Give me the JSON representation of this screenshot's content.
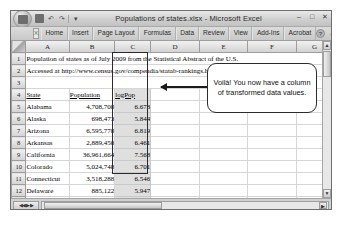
{
  "window": {
    "title": "Populations of states.xlsx - Microsoft Excel",
    "office_orb": "office-button",
    "quick_access": [
      {
        "name": "save",
        "glyph": ""
      },
      {
        "name": "undo",
        "glyph": "↶"
      },
      {
        "name": "redo",
        "glyph": "↷"
      },
      {
        "name": "customize",
        "glyph": "▾"
      }
    ],
    "buttons": {
      "minimize": "–",
      "maximize": "□",
      "close": "✕"
    }
  },
  "ribbon": {
    "logo": "X",
    "tabs": [
      "Home",
      "Insert",
      "Page Layout",
      "Formulas",
      "Data",
      "Review",
      "View",
      "Add-Ins",
      "Acrobat"
    ],
    "help": "?",
    "minimize": "–",
    "restore": "□",
    "close": "✕"
  },
  "sheet": {
    "corner": "",
    "columns": [
      "A",
      "B",
      "C",
      "D",
      "E",
      "F",
      "G"
    ],
    "rows": [
      {
        "number": "1",
        "cells": [
          {
            "text": "Population of states as of July 2009 from the Statistical Abstract of the U.S.",
            "span": 7,
            "align": "left",
            "selected": false,
            "underline": false
          }
        ]
      },
      {
        "number": "2",
        "cells": [
          {
            "text": "Accessed at http://www.census.gov/compendia/statab-rankings.html on July 3, 2010",
            "span": 7,
            "align": "left",
            "selected": false,
            "underline": false
          }
        ]
      },
      {
        "number": "3",
        "cells": [
          {
            "text": "",
            "span": 7,
            "align": "left",
            "selected": false,
            "underline": false
          }
        ]
      },
      {
        "number": "4",
        "cells": [
          {
            "text": "State",
            "span": 1,
            "align": "left",
            "selected": false,
            "underline": true
          },
          {
            "text": "Population",
            "span": 1,
            "align": "left",
            "selected": false,
            "underline": true
          },
          {
            "text": "logPop",
            "span": 1,
            "align": "left",
            "selected": true,
            "underline": true
          },
          {
            "text": "",
            "span": 1,
            "align": "left",
            "selected": false,
            "underline": false
          },
          {
            "text": "",
            "span": 1,
            "align": "left",
            "selected": false,
            "underline": false
          },
          {
            "text": "",
            "span": 1,
            "align": "left",
            "selected": false,
            "underline": false
          },
          {
            "text": "",
            "span": 1,
            "align": "left",
            "selected": false,
            "underline": false
          }
        ]
      },
      {
        "number": "5",
        "cells": [
          {
            "text": "Alabama",
            "span": 1,
            "align": "left",
            "selected": false,
            "underline": false
          },
          {
            "text": "4,708,708",
            "span": 1,
            "align": "right",
            "selected": false,
            "underline": false
          },
          {
            "text": "6.673",
            "span": 1,
            "align": "right",
            "selected": true,
            "underline": false
          },
          {
            "text": "",
            "span": 1,
            "align": "left",
            "selected": false,
            "underline": false
          },
          {
            "text": "",
            "span": 1,
            "align": "left",
            "selected": false,
            "underline": false
          },
          {
            "text": "",
            "span": 1,
            "align": "left",
            "selected": false,
            "underline": false
          },
          {
            "text": "",
            "span": 1,
            "align": "left",
            "selected": false,
            "underline": false
          }
        ]
      },
      {
        "number": "6",
        "cells": [
          {
            "text": "Alaska",
            "span": 1,
            "align": "left",
            "selected": false,
            "underline": false
          },
          {
            "text": "698,473",
            "span": 1,
            "align": "right",
            "selected": false,
            "underline": false
          },
          {
            "text": "5.844",
            "span": 1,
            "align": "right",
            "selected": true,
            "underline": false
          },
          {
            "text": "",
            "span": 1,
            "align": "left",
            "selected": false,
            "underline": false
          },
          {
            "text": "",
            "span": 1,
            "align": "left",
            "selected": false,
            "underline": false
          },
          {
            "text": "",
            "span": 1,
            "align": "left",
            "selected": false,
            "underline": false
          },
          {
            "text": "",
            "span": 1,
            "align": "left",
            "selected": false,
            "underline": false
          }
        ]
      },
      {
        "number": "7",
        "cells": [
          {
            "text": "Arizona",
            "span": 1,
            "align": "left",
            "selected": false,
            "underline": false
          },
          {
            "text": "6,595,778",
            "span": 1,
            "align": "right",
            "selected": false,
            "underline": false
          },
          {
            "text": "6.819",
            "span": 1,
            "align": "right",
            "selected": true,
            "underline": false
          },
          {
            "text": "",
            "span": 1,
            "align": "left",
            "selected": false,
            "underline": false
          },
          {
            "text": "",
            "span": 1,
            "align": "left",
            "selected": false,
            "underline": false
          },
          {
            "text": "",
            "span": 1,
            "align": "left",
            "selected": false,
            "underline": false
          },
          {
            "text": "",
            "span": 1,
            "align": "left",
            "selected": false,
            "underline": false
          }
        ]
      },
      {
        "number": "8",
        "cells": [
          {
            "text": "Arkansas",
            "span": 1,
            "align": "left",
            "selected": false,
            "underline": false
          },
          {
            "text": "2,889,450",
            "span": 1,
            "align": "right",
            "selected": false,
            "underline": false
          },
          {
            "text": "6.461",
            "span": 1,
            "align": "right",
            "selected": true,
            "underline": false
          },
          {
            "text": "",
            "span": 1,
            "align": "left",
            "selected": false,
            "underline": false
          },
          {
            "text": "",
            "span": 1,
            "align": "left",
            "selected": false,
            "underline": false
          },
          {
            "text": "",
            "span": 1,
            "align": "left",
            "selected": false,
            "underline": false
          },
          {
            "text": "",
            "span": 1,
            "align": "left",
            "selected": false,
            "underline": false
          }
        ]
      },
      {
        "number": "9",
        "cells": [
          {
            "text": "California",
            "span": 1,
            "align": "left",
            "selected": false,
            "underline": false
          },
          {
            "text": "36,961,664",
            "span": 1,
            "align": "right",
            "selected": false,
            "underline": false
          },
          {
            "text": "7.568",
            "span": 1,
            "align": "right",
            "selected": true,
            "underline": false
          },
          {
            "text": "",
            "span": 1,
            "align": "left",
            "selected": false,
            "underline": false
          },
          {
            "text": "",
            "span": 1,
            "align": "left",
            "selected": false,
            "underline": false
          },
          {
            "text": "",
            "span": 1,
            "align": "left",
            "selected": false,
            "underline": false
          },
          {
            "text": "",
            "span": 1,
            "align": "left",
            "selected": false,
            "underline": false
          }
        ]
      },
      {
        "number": "10",
        "cells": [
          {
            "text": "Colorado",
            "span": 1,
            "align": "left",
            "selected": false,
            "underline": false
          },
          {
            "text": "5,024,748",
            "span": 1,
            "align": "right",
            "selected": false,
            "underline": false
          },
          {
            "text": "6.701",
            "span": 1,
            "align": "right",
            "selected": true,
            "underline": false
          },
          {
            "text": "",
            "span": 1,
            "align": "left",
            "selected": false,
            "underline": false
          },
          {
            "text": "",
            "span": 1,
            "align": "left",
            "selected": false,
            "underline": false
          },
          {
            "text": "",
            "span": 1,
            "align": "left",
            "selected": false,
            "underline": false
          },
          {
            "text": "",
            "span": 1,
            "align": "left",
            "selected": false,
            "underline": false
          }
        ]
      },
      {
        "number": "11",
        "cells": [
          {
            "text": "Connecticut",
            "span": 1,
            "align": "left",
            "selected": false,
            "underline": false
          },
          {
            "text": "3,518,288",
            "span": 1,
            "align": "right",
            "selected": false,
            "underline": false
          },
          {
            "text": "6.546",
            "span": 1,
            "align": "right",
            "selected": true,
            "underline": false
          },
          {
            "text": "",
            "span": 1,
            "align": "left",
            "selected": false,
            "underline": false
          },
          {
            "text": "",
            "span": 1,
            "align": "left",
            "selected": false,
            "underline": false
          },
          {
            "text": "",
            "span": 1,
            "align": "left",
            "selected": false,
            "underline": false
          },
          {
            "text": "",
            "span": 1,
            "align": "left",
            "selected": false,
            "underline": false
          }
        ]
      },
      {
        "number": "12",
        "cells": [
          {
            "text": "Delaware",
            "span": 1,
            "align": "left",
            "selected": false,
            "underline": false
          },
          {
            "text": "885,122",
            "span": 1,
            "align": "right",
            "selected": false,
            "underline": false
          },
          {
            "text": "5.947",
            "span": 1,
            "align": "right",
            "selected": true,
            "underline": false
          },
          {
            "text": "",
            "span": 1,
            "align": "left",
            "selected": false,
            "underline": false
          },
          {
            "text": "",
            "span": 1,
            "align": "left",
            "selected": false,
            "underline": false
          },
          {
            "text": "",
            "span": 1,
            "align": "left",
            "selected": false,
            "underline": false
          },
          {
            "text": "",
            "span": 1,
            "align": "left",
            "selected": false,
            "underline": false
          }
        ]
      },
      {
        "number": "13",
        "cells": [
          {
            "text": "District of C",
            "span": 1,
            "align": "left",
            "selected": false,
            "underline": false
          },
          {
            "text": "599,657",
            "span": 1,
            "align": "right",
            "selected": false,
            "underline": false
          },
          {
            "text": "5.778",
            "span": 1,
            "align": "right",
            "selected": true,
            "underline": false
          },
          {
            "text": "",
            "span": 1,
            "align": "left",
            "selected": false,
            "underline": false
          },
          {
            "text": "",
            "span": 1,
            "align": "left",
            "selected": false,
            "underline": false
          },
          {
            "text": "",
            "span": 1,
            "align": "left",
            "selected": false,
            "underline": false
          },
          {
            "text": "",
            "span": 1,
            "align": "left",
            "selected": false,
            "underline": false
          }
        ]
      },
      {
        "number": "14",
        "cells": [
          {
            "text": "Florida",
            "span": 1,
            "align": "left",
            "selected": false,
            "underline": false
          },
          {
            "text": "18,437,969",
            "span": 1,
            "align": "right",
            "selected": false,
            "underline": false
          },
          {
            "text": "7.268",
            "span": 1,
            "align": "right",
            "selected": true,
            "underline": false
          },
          {
            "text": "",
            "span": 1,
            "align": "left",
            "selected": false,
            "underline": false
          },
          {
            "text": "",
            "span": 1,
            "align": "left",
            "selected": false,
            "underline": false
          },
          {
            "text": "",
            "span": 1,
            "align": "left",
            "selected": false,
            "underline": false
          },
          {
            "text": "",
            "span": 1,
            "align": "left",
            "selected": false,
            "underline": false
          }
        ]
      }
    ]
  },
  "callout": {
    "text": "Voilà! You now have a column of transformed data values."
  },
  "scrollbars": {
    "up_arrow": "▲",
    "down_arrow": "▼",
    "left_arrow": "◀",
    "right_arrow": "▶",
    "tab_nav": "◀◀ ▶▶"
  }
}
